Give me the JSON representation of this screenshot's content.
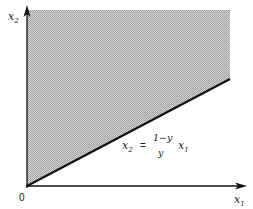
{
  "diagram": {
    "axes": {
      "x_label": "x",
      "x_sub": "1",
      "y_label": "x",
      "y_sub": "2",
      "origin_label": "0"
    },
    "region": {
      "description": "shaded feasible region above line",
      "fill": "#bdbdbd"
    },
    "line_equation": {
      "lhs": "x",
      "lhs_sub": "2",
      "equals": "=",
      "numerator": "1−y",
      "denominator": "y",
      "rhs": "x",
      "rhs_sub": "1"
    }
  }
}
